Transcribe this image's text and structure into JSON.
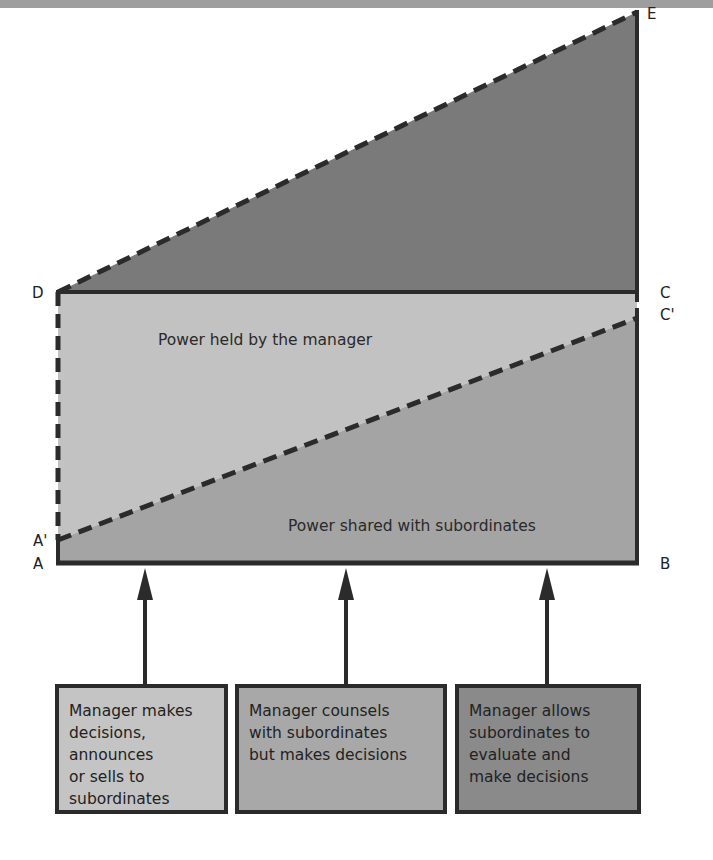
{
  "header": {
    "title_fragment": ""
  },
  "colors": {
    "top_triangle": "#7a7a7a",
    "manager_region": "#c2c2c2",
    "shared_region": "#a4a4a4",
    "box_1": "#c4c4c4",
    "box_2": "#a8a8a8",
    "box_3": "#8a8a8a",
    "outline": "#2b2b2b"
  },
  "vertices": {
    "A": "A",
    "A_prime": "A'",
    "B": "B",
    "C": "C",
    "C_prime": "C'",
    "D": "D",
    "E": "E"
  },
  "regions": {
    "manager": "Power held by the manager",
    "shared": "Power shared with subordinates"
  },
  "boxes": [
    {
      "lines": [
        "Manager makes",
        "decisions,",
        "announces",
        "or sells to",
        "subordinates"
      ]
    },
    {
      "lines": [
        "Manager counsels",
        "with subordinates",
        "but makes decisions"
      ]
    },
    {
      "lines": [
        "Manager allows",
        "subordinates to",
        "evaluate and",
        "make decisions"
      ]
    }
  ]
}
